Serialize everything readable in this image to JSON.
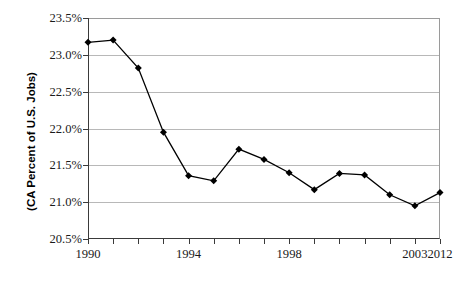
{
  "chart_data": {
    "type": "line",
    "title": "",
    "xlabel": "",
    "ylabel": "(CA Percent of U.S. Jobs)",
    "ylim": [
      20.5,
      23.5
    ],
    "xlim": [
      1990,
      2012
    ],
    "y_tick_labels": [
      "23.5%",
      "23.0%",
      "22.5%",
      "22.0%",
      "21.5%",
      "21.0%",
      "20.5%"
    ],
    "y_tick_values": [
      23.5,
      23.0,
      22.5,
      22.0,
      21.5,
      21.0,
      20.5
    ],
    "x_tick_labels": [
      "1990",
      "1994",
      "1998",
      "2003",
      "2012"
    ],
    "x_tick_values": [
      1990,
      1994,
      1998,
      2003,
      2012
    ],
    "x_tick_all": [
      1990,
      1991,
      1992,
      1993,
      1994,
      1995,
      1996,
      1997,
      1998,
      1999,
      2000,
      2001,
      2002,
      2003,
      2012
    ],
    "grid": true,
    "legend": false,
    "marker": "diamond",
    "marker_color": "#000000",
    "line_color": "#000000",
    "x": [
      1990,
      1991,
      1992,
      1993,
      1994,
      1995,
      1996,
      1997,
      1998,
      1999,
      2000,
      2001,
      2002,
      2003,
      2012
    ],
    "values": [
      23.17,
      23.2,
      22.82,
      21.95,
      21.36,
      21.29,
      21.72,
      21.58,
      21.4,
      21.17,
      21.39,
      21.37,
      21.1,
      20.95,
      21.13
    ],
    "series": [
      {
        "name": "CA Percent of U.S. Jobs",
        "values": [
          23.17,
          23.2,
          22.82,
          21.95,
          21.36,
          21.29,
          21.72,
          21.58,
          21.4,
          21.17,
          21.39,
          21.37,
          21.1,
          20.95,
          21.13
        ]
      }
    ]
  },
  "axis": {
    "y_title": "(CA Percent of U.S. Jobs)"
  }
}
